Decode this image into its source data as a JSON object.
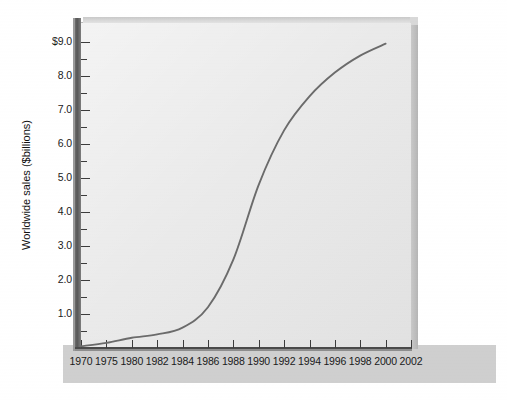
{
  "chart_data": {
    "type": "line",
    "title": "",
    "xlabel": "",
    "ylabel": "Worldwide sales ($billions)",
    "grid": false,
    "legend": null,
    "axis_style": "3d-beveled-panel",
    "x_axis": {
      "kind": "categorical",
      "tick_labels": [
        "1970",
        "1975",
        "1980",
        "1982",
        "1984",
        "1986",
        "1988",
        "1990",
        "1992",
        "1994",
        "1996",
        "1998",
        "2000",
        "2002"
      ],
      "note": "ticks evenly spaced although year intervals are uneven (5,5,2,2,...)"
    },
    "y_axis": {
      "tick_labels": [
        "$9.0",
        "8.0",
        "7.0",
        "6.0",
        "5.0",
        "4.0",
        "3.0",
        "2.0",
        "1.0"
      ],
      "major_values": [
        9.0,
        8.0,
        7.0,
        6.0,
        5.0,
        4.0,
        3.0,
        2.0,
        1.0
      ],
      "minor_step": 0.5,
      "ylim": [
        0,
        9.5
      ],
      "unit": "$billions"
    },
    "series": [
      {
        "name": "Worldwide sales",
        "x": [
          "1970",
          "1975",
          "1980",
          "1982",
          "1984",
          "1986",
          "1988",
          "1990",
          "1992",
          "1994",
          "1996",
          "1998",
          "2000",
          "2002"
        ],
        "values": [
          0.05,
          0.15,
          0.3,
          0.4,
          0.6,
          1.2,
          2.6,
          4.8,
          6.4,
          7.4,
          8.1,
          8.6,
          8.95,
          null
        ]
      }
    ],
    "colors": {
      "line": "#6b6b6b",
      "panel": "#e6e6e6",
      "panel_shadow": "#b9b9b9",
      "axis": "#4a4a4a",
      "outer_background": "#ffffff",
      "label_band": "#cfcfcf",
      "text": "#1a1a1a"
    }
  }
}
